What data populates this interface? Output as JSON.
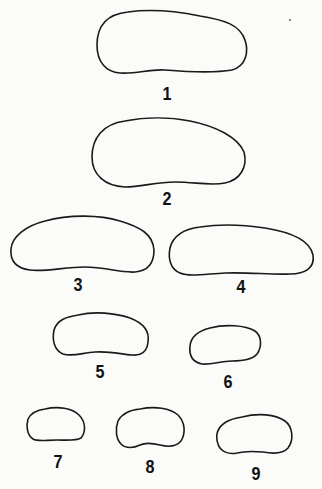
{
  "figure": {
    "type": "outline-series",
    "stroke_color": "#1a1a1a",
    "background_color": "#fbfbf9",
    "items": [
      {
        "label": "1",
        "bbox": [
          97,
          10,
          247,
          73
        ],
        "label_pos": [
          167,
          84
        ]
      },
      {
        "label": "2",
        "bbox": [
          92,
          118,
          245,
          187
        ],
        "label_pos": [
          167,
          189
        ]
      },
      {
        "label": "3",
        "bbox": [
          10,
          216,
          154,
          273
        ],
        "label_pos": [
          78,
          275
        ]
      },
      {
        "label": "4",
        "bbox": [
          169,
          225,
          314,
          276
        ],
        "label_pos": [
          241,
          277
        ]
      },
      {
        "label": "5",
        "bbox": [
          53,
          313,
          149,
          356
        ],
        "label_pos": [
          100,
          362
        ]
      },
      {
        "label": "6",
        "bbox": [
          189,
          325,
          261,
          364
        ],
        "label_pos": [
          228,
          372
        ]
      },
      {
        "label": "7",
        "bbox": [
          27,
          408,
          85,
          441
        ],
        "label_pos": [
          58,
          452
        ]
      },
      {
        "label": "8",
        "bbox": [
          116,
          408,
          184,
          449
        ],
        "label_pos": [
          150,
          457
        ]
      },
      {
        "label": "9",
        "bbox": [
          217,
          415,
          292,
          455
        ],
        "label_pos": [
          256,
          464
        ]
      }
    ]
  }
}
